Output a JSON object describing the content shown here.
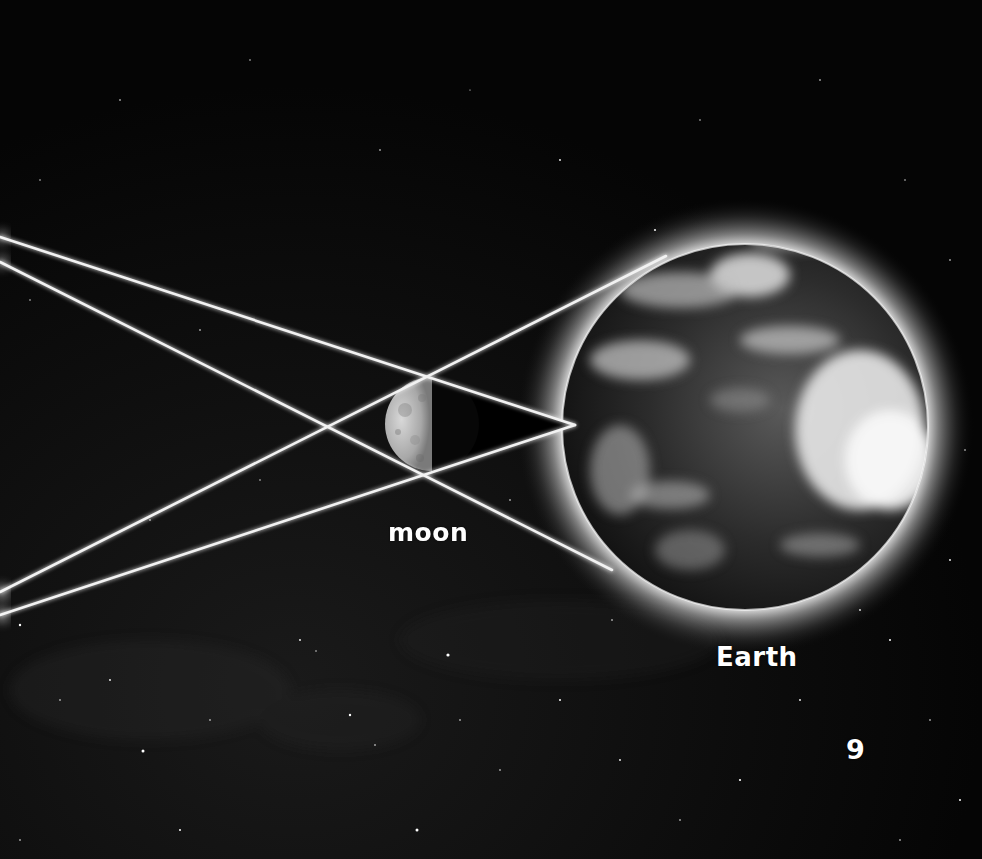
{
  "diagram": {
    "labels": {
      "moon": "moon",
      "earth": "Earth"
    },
    "page_number": "9",
    "bodies": [
      {
        "name": "moon",
        "cx": 432,
        "cy": 424,
        "r": 47,
        "lit_side": "left"
      },
      {
        "name": "Earth",
        "cx": 745,
        "cy": 427,
        "r": 183
      }
    ],
    "rays": [
      {
        "from": [
          0,
          237
        ],
        "to": [
          575,
          425
        ]
      },
      {
        "from": [
          0,
          262
        ],
        "to": [
          612,
          570
        ]
      },
      {
        "from": [
          0,
          592
        ],
        "to": [
          666,
          256
        ]
      },
      {
        "from": [
          0,
          615
        ],
        "to": [
          575,
          425
        ]
      }
    ],
    "umbra_tip": [
      575,
      425
    ],
    "colors": {
      "background": "#000000",
      "ray": "#f2f2f2",
      "label": "#ffffff",
      "halo": "#ffffff"
    }
  }
}
